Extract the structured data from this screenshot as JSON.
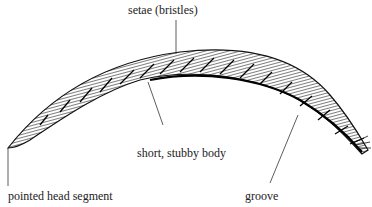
{
  "diagram": {
    "labels": {
      "setae": "setae (bristles)",
      "body": "short, stubby body",
      "head": "pointed head segment",
      "groove": "groove"
    }
  }
}
